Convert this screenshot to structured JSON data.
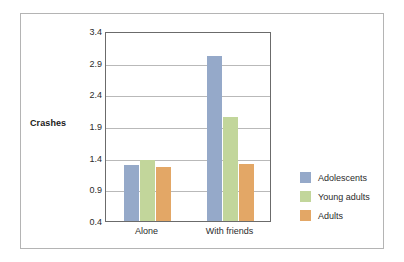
{
  "chart_data": {
    "type": "bar",
    "title": "",
    "subtitle": "",
    "xlabel": "",
    "ylabel": "Crashes",
    "categories": [
      "Alone",
      "With friends"
    ],
    "series": [
      {
        "name": "Adolescents",
        "color": "#95a9c9",
        "values": [
          1.28,
          3.0
        ]
      },
      {
        "name": "Young adults",
        "color": "#c2d69b",
        "values": [
          1.37,
          2.05
        ]
      },
      {
        "name": "Adults",
        "color": "#e3a766",
        "values": [
          1.25,
          1.3
        ]
      }
    ],
    "ylim": [
      0.4,
      3.4
    ],
    "ytick_labels": [
      "0.4",
      "0.9",
      "1.4",
      "1.9",
      "2.4",
      "2.9",
      "3.4"
    ],
    "ytick_values": [
      0.4,
      0.9,
      1.4,
      1.9,
      2.4,
      2.9,
      3.4
    ],
    "grid": true,
    "legend_position": "right"
  },
  "axis": {
    "y_title": "Crashes"
  },
  "legend": {
    "items": [
      {
        "label": "Adolescents",
        "color": "#95a9c9"
      },
      {
        "label": "Young adults",
        "color": "#c2d69b"
      },
      {
        "label": "Adults",
        "color": "#e3a766"
      }
    ]
  },
  "colors": {
    "adolescents": "#95a9c9",
    "young_adults": "#c2d69b",
    "adults": "#e3a766",
    "gridline": "#b9b9b9",
    "plot_border": "#6b6b6b",
    "outer_border": "#b4b4b4",
    "text": "#2b2b2b",
    "background": "#ffffff"
  }
}
